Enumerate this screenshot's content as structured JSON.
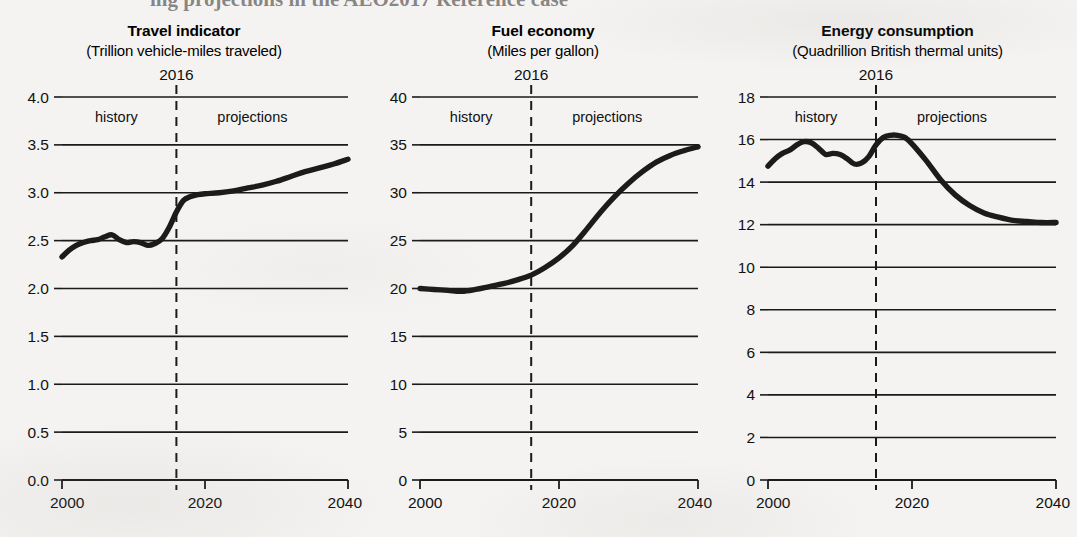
{
  "figure": {
    "background_color": "#f4f3f1",
    "ink_color": "#1b1b1b",
    "partial_heading_top": "ing projections in the AEO2017 Reference case"
  },
  "chart_data": [
    {
      "type": "line",
      "title": "Travel indicator",
      "subtitle": "(Trillion vehicle-miles traveled)",
      "xlabel": "",
      "ylabel": "",
      "xlim": [
        2000,
        2040
      ],
      "ylim": [
        0.0,
        4.0
      ],
      "xticks": [
        2000,
        2020,
        2040
      ],
      "xtick_labels": [
        "2000",
        "2020",
        "2040"
      ],
      "yticks": [
        0.0,
        0.5,
        1.0,
        1.5,
        2.0,
        2.5,
        3.0,
        3.5,
        4.0
      ],
      "ytick_labels": [
        "0.0",
        "0.5",
        "1.0",
        "1.5",
        "2.0",
        "2.5",
        "3.0",
        "3.5",
        "4.0"
      ],
      "grid": true,
      "divider_year": 2016,
      "divider_label": "2016",
      "history_label": "history",
      "projections_label": "projections",
      "x": [
        2000,
        2001,
        2002,
        2003,
        2004,
        2005,
        2006,
        2007,
        2008,
        2009,
        2010,
        2011,
        2012,
        2013,
        2014,
        2015,
        2016,
        2017,
        2018,
        2019,
        2020,
        2022,
        2024,
        2026,
        2028,
        2030,
        2032,
        2034,
        2036,
        2038,
        2040
      ],
      "values": [
        2.33,
        2.4,
        2.45,
        2.48,
        2.5,
        2.51,
        2.54,
        2.56,
        2.51,
        2.48,
        2.49,
        2.48,
        2.45,
        2.47,
        2.52,
        2.64,
        2.8,
        2.92,
        2.96,
        2.98,
        2.99,
        3.0,
        3.02,
        3.05,
        3.08,
        3.12,
        3.17,
        3.22,
        3.26,
        3.3,
        3.35
      ]
    },
    {
      "type": "line",
      "title": "Fuel economy",
      "subtitle": "(Miles per gallon)",
      "xlabel": "",
      "ylabel": "",
      "xlim": [
        2000,
        2040
      ],
      "ylim": [
        0,
        40
      ],
      "xticks": [
        2000,
        2020,
        2040
      ],
      "xtick_labels": [
        "2000",
        "2020",
        "2040"
      ],
      "yticks": [
        0,
        5,
        10,
        15,
        20,
        25,
        30,
        35,
        40
      ],
      "ytick_labels": [
        "0",
        "5",
        "10",
        "15",
        "20",
        "25",
        "30",
        "35",
        "40"
      ],
      "grid": true,
      "divider_year": 2016,
      "divider_label": "2016",
      "history_label": "history",
      "projections_label": "projections",
      "x": [
        2000,
        2002,
        2004,
        2006,
        2008,
        2010,
        2012,
        2014,
        2016,
        2018,
        2020,
        2022,
        2024,
        2026,
        2028,
        2030,
        2032,
        2034,
        2036,
        2038,
        2040
      ],
      "values": [
        20.0,
        19.9,
        19.8,
        19.7,
        19.9,
        20.2,
        20.5,
        20.9,
        21.4,
        22.2,
        23.2,
        24.5,
        26.2,
        28.0,
        29.6,
        31.0,
        32.2,
        33.2,
        33.9,
        34.4,
        34.8
      ]
    },
    {
      "type": "line",
      "title": "Energy consumption",
      "subtitle": "(Quadrillion British thermal units)",
      "xlabel": "",
      "ylabel": "",
      "xlim": [
        2000,
        2040
      ],
      "ylim": [
        0,
        18
      ],
      "xticks": [
        2000,
        2020,
        2040
      ],
      "xtick_labels": [
        "2000",
        "2020",
        "2040"
      ],
      "yticks": [
        0,
        2,
        4,
        6,
        8,
        10,
        12,
        14,
        16,
        18
      ],
      "ytick_labels": [
        "0",
        "2",
        "4",
        "6",
        "8",
        "10",
        "12",
        "14",
        "16",
        "18"
      ],
      "grid": true,
      "divider_year": 2015,
      "divider_label": "2016",
      "history_label": "history",
      "projections_label": "projections",
      "x": [
        2000,
        2001,
        2002,
        2003,
        2004,
        2005,
        2006,
        2007,
        2008,
        2009,
        2010,
        2011,
        2012,
        2013,
        2014,
        2015,
        2016,
        2017,
        2018,
        2019,
        2020,
        2022,
        2024,
        2026,
        2028,
        2030,
        2032,
        2034,
        2036,
        2038,
        2040
      ],
      "values": [
        14.75,
        15.1,
        15.35,
        15.5,
        15.75,
        15.9,
        15.85,
        15.6,
        15.3,
        15.35,
        15.3,
        15.1,
        14.85,
        14.9,
        15.2,
        15.75,
        16.1,
        16.2,
        16.2,
        16.1,
        15.8,
        15.0,
        14.1,
        13.4,
        12.9,
        12.55,
        12.35,
        12.2,
        12.15,
        12.1,
        12.1
      ]
    }
  ]
}
